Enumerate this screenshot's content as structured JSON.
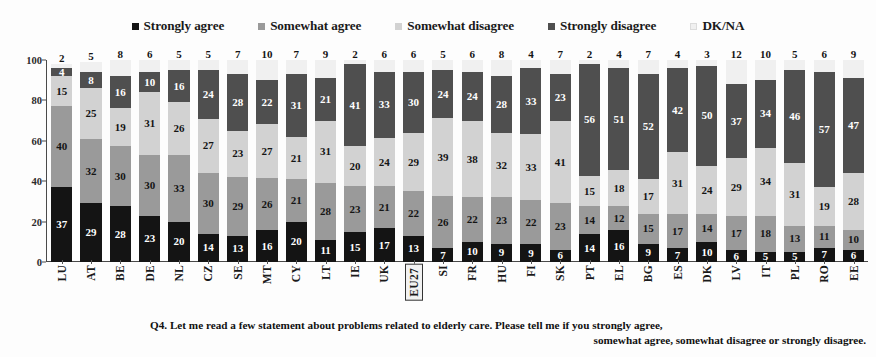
{
  "legend": {
    "position": "top-center",
    "items": [
      {
        "label": "Strongly agree",
        "color": "#141414",
        "marker": "square-marker"
      },
      {
        "label": "Somewhat agree",
        "color": "#9a9a9a",
        "marker": "square-marker"
      },
      {
        "label": "Somewhat disagree",
        "color": "#d2d2d2",
        "marker": "square-marker"
      },
      {
        "label": "Strongly disagree",
        "color": "#4f4f4f",
        "marker": "square-marker"
      },
      {
        "label": "DK/NA",
        "color": "#f0f0f0",
        "marker": "square-marker"
      }
    ]
  },
  "axis": {
    "y_ticks": [
      "0",
      "20",
      "40",
      "60",
      "80",
      "100"
    ],
    "y_min": 0,
    "y_max": 100
  },
  "caption": {
    "line1": "Q4. Let me read a few statement about problems related to elderly care. Please tell me if you strongly agree,",
    "line2": "somewhat agree, somewhat disagree or strongly disagree."
  },
  "chart_data": {
    "type": "bar",
    "subtype": "stacked-bar-100-percent",
    "title": "",
    "xlabel": "",
    "ylabel": "",
    "ylim": [
      0,
      100
    ],
    "grid": false,
    "legend_position": "top-center",
    "highlighted_category": "EU27",
    "categories": [
      "LU",
      "AT",
      "BE",
      "DE",
      "NL",
      "CZ",
      "SE",
      "MT",
      "CY",
      "LT",
      "IE",
      "UK",
      "EU27",
      "SI",
      "FR",
      "HU",
      "FI",
      "SK",
      "PT",
      "EL",
      "BG",
      "ES",
      "DK",
      "LV",
      "IT",
      "PL",
      "RO",
      "EE"
    ],
    "series": [
      {
        "name": "Strongly agree",
        "color": "#141414",
        "values": [
          37,
          29,
          28,
          23,
          20,
          14,
          13,
          16,
          20,
          11,
          15,
          17,
          13,
          7,
          10,
          9,
          9,
          6,
          14,
          16,
          9,
          7,
          10,
          6,
          5,
          5,
          7,
          6
        ]
      },
      {
        "name": "Somewhat agree",
        "color": "#9a9a9a",
        "values": [
          40,
          32,
          30,
          30,
          33,
          30,
          29,
          26,
          21,
          28,
          23,
          21,
          22,
          26,
          22,
          23,
          22,
          23,
          14,
          12,
          15,
          17,
          14,
          17,
          18,
          13,
          11,
          10
        ]
      },
      {
        "name": "Somewhat disagree",
        "color": "#d2d2d2",
        "values": [
          15,
          25,
          19,
          31,
          26,
          27,
          23,
          27,
          21,
          31,
          20,
          24,
          29,
          39,
          38,
          32,
          33,
          41,
          15,
          18,
          17,
          31,
          24,
          29,
          34,
          31,
          19,
          28
        ]
      },
      {
        "name": "Strongly disagree",
        "color": "#4f4f4f",
        "values": [
          4,
          8,
          16,
          10,
          16,
          24,
          28,
          22,
          31,
          21,
          41,
          33,
          30,
          24,
          24,
          28,
          33,
          23,
          56,
          51,
          52,
          42,
          50,
          37,
          34,
          46,
          57,
          47
        ]
      },
      {
        "name": "DK/NA",
        "color": "#f0f0f0",
        "values": [
          2,
          5,
          8,
          6,
          5,
          5,
          7,
          10,
          7,
          9,
          2,
          6,
          6,
          5,
          6,
          8,
          4,
          7,
          2,
          4,
          7,
          4,
          3,
          12,
          10,
          5,
          6,
          9
        ]
      }
    ]
  }
}
